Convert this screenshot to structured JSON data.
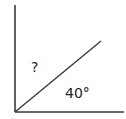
{
  "diagram": {
    "type": "angle-diagram",
    "unknown_label": "?",
    "known_angle_label": "40°",
    "line_color": "#3a3a3a",
    "text_color": "#222222",
    "lines": {
      "vertical": {
        "x1": 15,
        "y1": 5,
        "x2": 15,
        "y2": 112
      },
      "horizontal": {
        "x1": 15,
        "y1": 112,
        "x2": 124,
        "y2": 112
      },
      "diagonal": {
        "x1": 15,
        "y1": 112,
        "x2": 101,
        "y2": 41
      }
    }
  }
}
